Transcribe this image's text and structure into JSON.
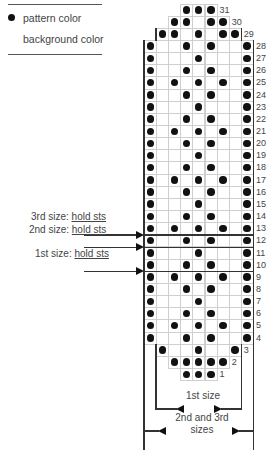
{
  "legend": {
    "items": [
      {
        "symbol": "filled-dot",
        "label": "pattern color"
      },
      {
        "symbol": "blank",
        "label": "background color"
      }
    ]
  },
  "chart": {
    "columns": 9,
    "rows": [
      {
        "row": 1,
        "span": [
          4,
          6
        ],
        "filled": [
          4,
          5,
          6
        ]
      },
      {
        "row": 2,
        "span": [
          3,
          7
        ],
        "filled": [
          3,
          4,
          5,
          6,
          7
        ]
      },
      {
        "row": 3,
        "span": [
          2,
          8
        ],
        "filled": [
          2,
          5,
          8
        ]
      },
      {
        "row": 4,
        "span": [
          1,
          9
        ],
        "filled": [
          1,
          4,
          6,
          9
        ]
      },
      {
        "row": 5,
        "span": [
          1,
          9
        ],
        "filled": [
          1,
          3,
          5,
          7,
          9
        ]
      },
      {
        "row": 6,
        "span": [
          1,
          9
        ],
        "filled": [
          1,
          4,
          6,
          9
        ]
      },
      {
        "row": 7,
        "span": [
          1,
          9
        ],
        "filled": [
          1,
          5,
          9
        ]
      },
      {
        "row": 8,
        "span": [
          1,
          9
        ],
        "filled": [
          1,
          4,
          6,
          9
        ]
      },
      {
        "row": 9,
        "span": [
          1,
          9
        ],
        "filled": [
          1,
          3,
          5,
          7,
          9
        ]
      },
      {
        "row": 10,
        "span": [
          1,
          9
        ],
        "filled": [
          1,
          4,
          6,
          9
        ]
      },
      {
        "row": 11,
        "span": [
          1,
          9
        ],
        "filled": [
          1,
          5,
          9
        ]
      },
      {
        "row": 12,
        "span": [
          1,
          9
        ],
        "filled": [
          1,
          4,
          6,
          9
        ]
      },
      {
        "row": 13,
        "span": [
          1,
          9
        ],
        "filled": [
          1,
          3,
          5,
          7,
          9
        ]
      },
      {
        "row": 14,
        "span": [
          1,
          9
        ],
        "filled": [
          1,
          4,
          6,
          9
        ]
      },
      {
        "row": 15,
        "span": [
          1,
          9
        ],
        "filled": [
          1,
          5,
          9
        ]
      },
      {
        "row": 16,
        "span": [
          1,
          9
        ],
        "filled": [
          1,
          4,
          6,
          9
        ]
      },
      {
        "row": 17,
        "span": [
          1,
          9
        ],
        "filled": [
          1,
          3,
          5,
          7,
          9
        ]
      },
      {
        "row": 18,
        "span": [
          1,
          9
        ],
        "filled": [
          1,
          4,
          6,
          9
        ]
      },
      {
        "row": 19,
        "span": [
          1,
          9
        ],
        "filled": [
          1,
          5,
          9
        ]
      },
      {
        "row": 20,
        "span": [
          1,
          9
        ],
        "filled": [
          1,
          4,
          6,
          9
        ]
      },
      {
        "row": 21,
        "span": [
          1,
          9
        ],
        "filled": [
          1,
          3,
          5,
          7,
          9
        ]
      },
      {
        "row": 22,
        "span": [
          1,
          9
        ],
        "filled": [
          1,
          4,
          6,
          9
        ]
      },
      {
        "row": 23,
        "span": [
          1,
          9
        ],
        "filled": [
          1,
          5,
          9
        ]
      },
      {
        "row": 24,
        "span": [
          1,
          9
        ],
        "filled": [
          1,
          4,
          6,
          9
        ]
      },
      {
        "row": 25,
        "span": [
          1,
          9
        ],
        "filled": [
          1,
          3,
          5,
          7,
          9
        ]
      },
      {
        "row": 26,
        "span": [
          1,
          9
        ],
        "filled": [
          1,
          4,
          6,
          9
        ]
      },
      {
        "row": 27,
        "span": [
          1,
          9
        ],
        "filled": [
          1,
          5,
          9
        ]
      },
      {
        "row": 28,
        "span": [
          1,
          9
        ],
        "filled": [
          1,
          4,
          6,
          9
        ]
      },
      {
        "row": 29,
        "span": [
          2,
          8
        ],
        "filled": [
          2,
          3,
          5,
          7,
          8
        ]
      },
      {
        "row": 30,
        "span": [
          3,
          7
        ],
        "filled": [
          3,
          4,
          6,
          7
        ]
      },
      {
        "row": 31,
        "span": [
          4,
          6
        ],
        "filled": [
          4,
          5,
          6
        ]
      }
    ]
  },
  "hold_markers": [
    {
      "label_size": "3rd size:",
      "label_action": "hold sts",
      "after_row": 13
    },
    {
      "label_size": "2nd size:",
      "label_action": "hold sts",
      "after_row": 12
    },
    {
      "label_size": "1st size:",
      "label_action": "hold sts",
      "after_row": 10
    }
  ],
  "size_brackets": [
    {
      "label": "1st size"
    },
    {
      "label_line1": "2nd and 3rd",
      "label_line2": "sizes"
    }
  ],
  "colors": {
    "pattern": "#111111",
    "grid": "#cfcfcf",
    "lines": "#333333"
  }
}
